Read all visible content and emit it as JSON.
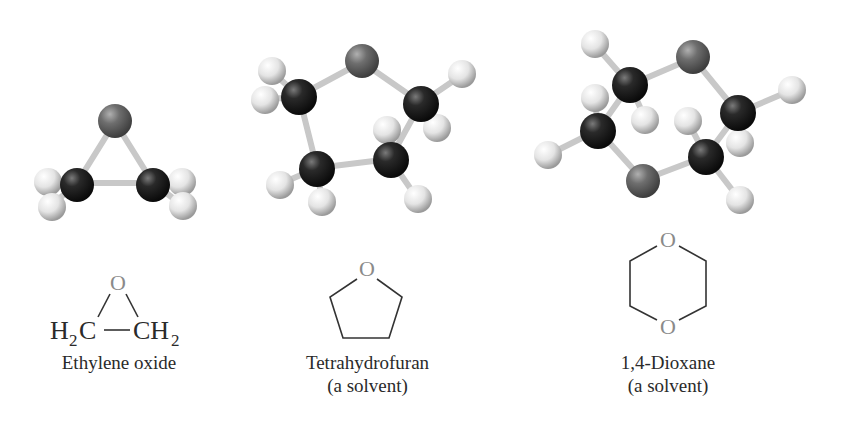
{
  "figure": {
    "molecules": [
      {
        "id": "ethylene-oxide",
        "name": "Ethylene oxide",
        "note": "",
        "structural_formula": {
          "left_group": "H",
          "left_sub": "2",
          "left_atom": "C",
          "right_atom": "CH",
          "right_sub": "2",
          "ring_atom": "O"
        }
      },
      {
        "id": "tetrahydrofuran",
        "name": "Tetrahydrofuran",
        "note": "(a solvent)",
        "structural_formula": {
          "ring_atom": "O"
        }
      },
      {
        "id": "dioxane",
        "name": "1,4-Dioxane",
        "note": "(a solvent)",
        "structural_formula": {
          "ring_atom_top": "O",
          "ring_atom_bottom": "O"
        }
      }
    ],
    "colors": {
      "carbon": "#1a1a1a",
      "oxygen": "#6e6e6e",
      "hydrogen": "#e6e6e6",
      "bond": "#cfcfcf",
      "line": "#333333",
      "text": "#2a2a2a"
    }
  }
}
